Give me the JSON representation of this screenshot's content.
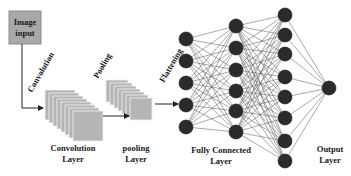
{
  "diagram": {
    "input_box": {
      "line1": "Image",
      "line2": "input",
      "color": "#a8a8a8"
    },
    "stage_labels": {
      "convolution": "Convolution",
      "pooling": "Pooling",
      "flattening": "Flattening"
    },
    "layer_labels": {
      "conv_line1": "Convolution",
      "conv_line2": "Layer",
      "pool_line1": "pooling",
      "pool_line2": "Layer",
      "fc_line1": "Fully Connected",
      "fc_line2": "Layer",
      "out_line1": "Output",
      "out_line2": "Layer"
    },
    "network": {
      "columns": [
        {
          "x": 186,
          "ys": [
            39,
            61,
            83,
            105,
            127
          ]
        },
        {
          "x": 236,
          "ys": [
            26,
            48,
            70,
            91,
            111,
            132
          ]
        },
        {
          "x": 285,
          "ys": [
            15,
            35,
            54,
            77,
            97,
            118,
            141,
            161
          ]
        },
        {
          "x": 329,
          "ys": [
            88
          ]
        }
      ],
      "node_radius": 7,
      "node_color": "#2b2b2b",
      "edge_color": "#555555"
    },
    "feature_maps": {
      "conv": {
        "count": 8,
        "color": "#b5b5b5"
      },
      "pool": {
        "count": 7,
        "color": "#b5b5b5"
      }
    }
  }
}
